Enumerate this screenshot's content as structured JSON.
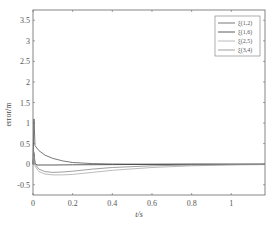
{
  "chart_data": {
    "type": "line",
    "title": "",
    "xlabel": "t/s",
    "ylabel": "error/m",
    "xlim": [
      0,
      1.17
    ],
    "ylim": [
      -0.75,
      3.75
    ],
    "xticks": [
      0,
      0.2,
      0.4,
      0.6,
      0.8,
      1
    ],
    "xtick_labels": [
      "0",
      "0.2",
      "0.4",
      "0.6",
      "0.8",
      "1"
    ],
    "yticks": [
      -0.5,
      0,
      0.5,
      1,
      1.5,
      2,
      2.5,
      3,
      3.5
    ],
    "ytick_labels": [
      "-0.5",
      "0",
      "0.5",
      "1",
      "1.5",
      "2",
      "2.5",
      "3",
      "3.5"
    ],
    "grid": false,
    "legend_position": "upper right",
    "series": [
      {
        "name": "ξ(1,2)",
        "color": "#555555",
        "x": [
          0,
          0.005,
          0.01,
          0.03,
          0.06,
          0.1,
          0.15,
          0.2,
          0.3,
          0.4,
          0.6,
          0.8,
          1.0,
          1.17
        ],
        "y": [
          0,
          1.1,
          0.45,
          0.33,
          0.22,
          0.14,
          0.08,
          0.04,
          0.015,
          0.005,
          0,
          0,
          0,
          0
        ]
      },
      {
        "name": "ξ(1,6)",
        "color": "#333333",
        "x": [
          0,
          0.005,
          0.01,
          0.02,
          0.05,
          0.1,
          0.2,
          0.4,
          0.6,
          0.8,
          1.0,
          1.17
        ],
        "y": [
          0,
          0.25,
          0.02,
          -0.02,
          -0.02,
          -0.02,
          -0.015,
          -0.01,
          -0.005,
          0,
          0,
          0
        ]
      },
      {
        "name": "ξ(2,5)",
        "color": "#aaaaaa",
        "x": [
          0,
          0.005,
          0.01,
          0.03,
          0.06,
          0.1,
          0.15,
          0.2,
          0.3,
          0.4,
          0.6,
          0.8,
          1.0,
          1.17
        ],
        "y": [
          0,
          0.2,
          -0.05,
          -0.18,
          -0.24,
          -0.26,
          -0.26,
          -0.25,
          -0.2,
          -0.15,
          -0.08,
          -0.04,
          -0.02,
          -0.01
        ]
      },
      {
        "name": "ξ(3,4)",
        "color": "#888888",
        "x": [
          0,
          0.005,
          0.01,
          0.03,
          0.06,
          0.1,
          0.15,
          0.2,
          0.3,
          0.4,
          0.6,
          0.8,
          1.0,
          1.17
        ],
        "y": [
          0,
          0.3,
          0.0,
          -0.12,
          -0.18,
          -0.2,
          -0.19,
          -0.17,
          -0.12,
          -0.08,
          -0.04,
          -0.02,
          -0.01,
          0
        ]
      }
    ]
  }
}
